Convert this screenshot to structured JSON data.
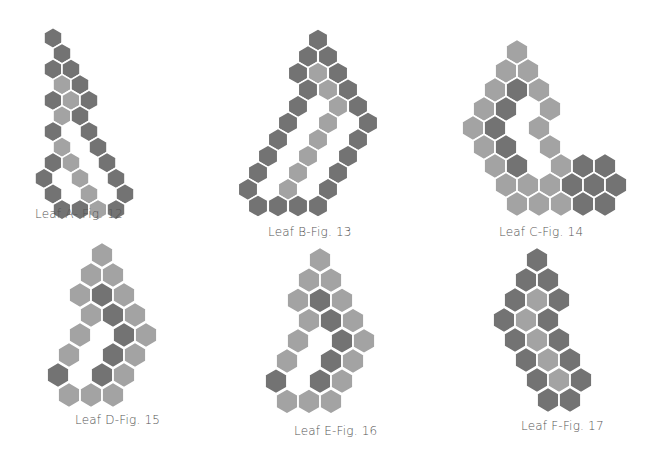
{
  "colors": {
    "dark": "#737373",
    "light": "#a3a3a3",
    "gap": "#ffffff"
  },
  "figures": [
    {
      "id": "A",
      "label": "Leaf A- Fig. 12",
      "label_pos": [
        35,
        207
      ],
      "hex_w": 18,
      "row_h": 15.6,
      "top": 38,
      "rows": [
        [
          [
            53,
            "D"
          ]
        ],
        [
          [
            62,
            "D"
          ]
        ],
        [
          [
            53,
            "D"
          ],
          [
            71,
            "D"
          ]
        ],
        [
          [
            62,
            "L"
          ],
          [
            80,
            "D"
          ]
        ],
        [
          [
            53,
            "D"
          ],
          [
            71,
            "L"
          ],
          [
            89,
            "D"
          ]
        ],
        [
          [
            62,
            "L"
          ],
          [
            80,
            "D"
          ]
        ],
        [
          [
            53,
            "D"
          ],
          [
            89,
            "D"
          ]
        ],
        [
          [
            62,
            "L"
          ],
          [
            98,
            "D"
          ]
        ],
        [
          [
            53,
            "D"
          ],
          [
            71,
            "L"
          ],
          [
            107,
            "D"
          ]
        ],
        [
          [
            44,
            "D"
          ],
          [
            80,
            "L"
          ],
          [
            116,
            "D"
          ]
        ],
        [
          [
            53,
            "D"
          ],
          [
            89,
            "L"
          ],
          [
            125,
            "D"
          ]
        ],
        [
          [
            62,
            "D"
          ],
          [
            80,
            "D"
          ],
          [
            98,
            "L"
          ],
          [
            116,
            "D"
          ]
        ]
      ]
    },
    {
      "id": "B",
      "label": "Leaf B-Fig. 13",
      "label_pos": [
        268,
        225
      ],
      "hex_w": 19.5,
      "row_h": 16.6,
      "top": 40,
      "rows": [
        [
          [
            318,
            "D"
          ]
        ],
        [
          [
            308,
            "D"
          ],
          [
            328,
            "D"
          ]
        ],
        [
          [
            298,
            "D"
          ],
          [
            318,
            "L"
          ],
          [
            338,
            "D"
          ]
        ],
        [
          [
            308,
            "D"
          ],
          [
            328,
            "L"
          ],
          [
            348,
            "D"
          ]
        ],
        [
          [
            298,
            "D"
          ],
          [
            338,
            "L"
          ],
          [
            358,
            "D"
          ]
        ],
        [
          [
            288,
            "D"
          ],
          [
            328,
            "L"
          ],
          [
            368,
            "D"
          ]
        ],
        [
          [
            278,
            "D"
          ],
          [
            318,
            "L"
          ],
          [
            358,
            "D"
          ]
        ],
        [
          [
            268,
            "D"
          ],
          [
            308,
            "L"
          ],
          [
            348,
            "D"
          ]
        ],
        [
          [
            258,
            "D"
          ],
          [
            298,
            "L"
          ],
          [
            338,
            "D"
          ]
        ],
        [
          [
            248,
            "D"
          ],
          [
            288,
            "L"
          ],
          [
            328,
            "D"
          ]
        ],
        [
          [
            258,
            "D"
          ],
          [
            278,
            "D"
          ],
          [
            298,
            "D"
          ],
          [
            318,
            "D"
          ]
        ]
      ]
    },
    {
      "id": "C",
      "label": "Leaf C-Fig. 14",
      "label_pos": [
        499,
        225
      ],
      "hex_w": 21.8,
      "row_h": 19,
      "top": 52,
      "rows": [
        [
          [
            517,
            "L"
          ]
        ],
        [
          [
            506,
            "L"
          ],
          [
            528,
            "L"
          ]
        ],
        [
          [
            495,
            "L"
          ],
          [
            517,
            "D"
          ],
          [
            539,
            "L"
          ]
        ],
        [
          [
            484,
            "L"
          ],
          [
            506,
            "D"
          ],
          [
            550,
            "L"
          ]
        ],
        [
          [
            473,
            "L"
          ],
          [
            495,
            "D"
          ],
          [
            539,
            "L"
          ]
        ],
        [
          [
            484,
            "L"
          ],
          [
            506,
            "D"
          ],
          [
            550,
            "L"
          ]
        ],
        [
          [
            495,
            "L"
          ],
          [
            517,
            "D"
          ],
          [
            561,
            "L"
          ],
          [
            583,
            "D"
          ],
          [
            605,
            "D"
          ]
        ],
        [
          [
            506,
            "L"
          ],
          [
            528,
            "L"
          ],
          [
            550,
            "L"
          ],
          [
            572,
            "D"
          ],
          [
            594,
            "D"
          ],
          [
            616,
            "D"
          ]
        ],
        [
          [
            517,
            "L"
          ],
          [
            539,
            "L"
          ],
          [
            561,
            "L"
          ],
          [
            583,
            "D"
          ],
          [
            605,
            "D"
          ]
        ]
      ]
    },
    {
      "id": "D",
      "label": "Leaf D-Fig. 15",
      "label_pos": [
        75,
        413
      ],
      "hex_w": 21.8,
      "row_h": 20,
      "top": 255,
      "rows": [
        [
          [
            102,
            "L"
          ]
        ],
        [
          [
            91,
            "L"
          ],
          [
            113,
            "L"
          ]
        ],
        [
          [
            80,
            "L"
          ],
          [
            102,
            "D"
          ],
          [
            124,
            "L"
          ]
        ],
        [
          [
            91,
            "L"
          ],
          [
            113,
            "D"
          ],
          [
            135,
            "L"
          ]
        ],
        [
          [
            80,
            "L"
          ],
          [
            124,
            "D"
          ],
          [
            146,
            "L"
          ]
        ],
        [
          [
            69,
            "L"
          ],
          [
            113,
            "D"
          ],
          [
            135,
            "L"
          ]
        ],
        [
          [
            58,
            "D"
          ],
          [
            102,
            "D"
          ],
          [
            124,
            "L"
          ]
        ],
        [
          [
            69,
            "L"
          ],
          [
            91,
            "L"
          ],
          [
            113,
            "L"
          ]
        ]
      ]
    },
    {
      "id": "E",
      "label": "Leaf E-Fig. 16",
      "label_pos": [
        294,
        424
      ],
      "hex_w": 21.8,
      "row_h": 20.2,
      "top": 260,
      "rows": [
        [
          [
            320,
            "L"
          ]
        ],
        [
          [
            309,
            "L"
          ],
          [
            331,
            "L"
          ]
        ],
        [
          [
            298,
            "L"
          ],
          [
            320,
            "D"
          ],
          [
            342,
            "L"
          ]
        ],
        [
          [
            309,
            "L"
          ],
          [
            331,
            "D"
          ],
          [
            353,
            "L"
          ]
        ],
        [
          [
            298,
            "L"
          ],
          [
            342,
            "D"
          ],
          [
            364,
            "L"
          ]
        ],
        [
          [
            287,
            "L"
          ],
          [
            331,
            "D"
          ],
          [
            353,
            "L"
          ]
        ],
        [
          [
            276,
            "D"
          ],
          [
            320,
            "D"
          ],
          [
            342,
            "L"
          ]
        ],
        [
          [
            287,
            "L"
          ],
          [
            309,
            "L"
          ],
          [
            331,
            "L"
          ]
        ]
      ]
    },
    {
      "id": "F",
      "label": "Leaf F-Fig. 17",
      "label_pos": [
        521,
        419
      ],
      "hex_w": 21.8,
      "row_h": 20,
      "top": 260,
      "rows": [
        [
          [
            537,
            "D"
          ]
        ],
        [
          [
            526,
            "D"
          ],
          [
            548,
            "D"
          ]
        ],
        [
          [
            515,
            "D"
          ],
          [
            537,
            "L"
          ],
          [
            559,
            "D"
          ]
        ],
        [
          [
            504,
            "D"
          ],
          [
            526,
            "L"
          ],
          [
            548,
            "D"
          ]
        ],
        [
          [
            515,
            "D"
          ],
          [
            537,
            "L"
          ],
          [
            559,
            "D"
          ]
        ],
        [
          [
            526,
            "D"
          ],
          [
            548,
            "L"
          ],
          [
            570,
            "D"
          ]
        ],
        [
          [
            537,
            "D"
          ],
          [
            559,
            "L"
          ],
          [
            581,
            "D"
          ]
        ],
        [
          [
            548,
            "D"
          ],
          [
            570,
            "D"
          ]
        ]
      ]
    }
  ]
}
